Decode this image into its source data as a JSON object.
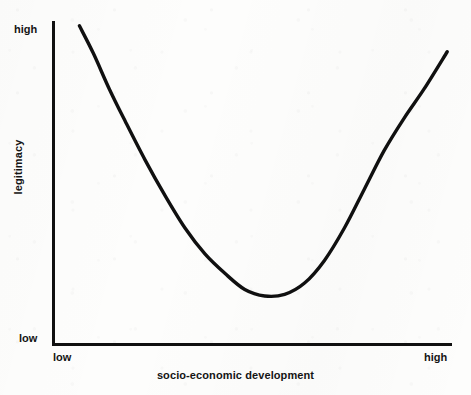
{
  "figure": {
    "background_color": "#fdfdfc",
    "ink_color": "#101010",
    "width": 471,
    "height": 395
  },
  "chart_data": {
    "type": "line",
    "title": "",
    "subtitle": "",
    "xlabel": "socio-economic development",
    "ylabel": "legitimacy",
    "grid": false,
    "legend": null,
    "legend_position": "none",
    "xlim": [
      0,
      100
    ],
    "ylim": [
      0,
      100
    ],
    "x_tick_labels": [
      "low",
      "high"
    ],
    "y_tick_labels": [
      "low",
      "high"
    ],
    "x_tick_positions": [
      0,
      100
    ],
    "y_tick_positions": [
      0,
      100
    ],
    "annotations": [],
    "series": [
      {
        "name": "legitimacy",
        "color": "#101010",
        "line_width": 3,
        "x": [
          6.5,
          10,
          14,
          18,
          23,
          28,
          33,
          38,
          43,
          48,
          53,
          58,
          63,
          68,
          73,
          78,
          83,
          88,
          93,
          98.8
        ],
        "y": [
          98.5,
          90,
          79,
          69,
          57,
          46,
          36,
          28,
          22,
          17,
          15,
          15.5,
          19,
          26,
          36,
          48,
          60,
          70,
          79,
          90.5
        ]
      }
    ]
  },
  "labels": {
    "y_axis_high": "high",
    "y_axis_low": "low",
    "x_axis_low": "low",
    "x_axis_high": "high",
    "x_axis_title": "socio-economic development",
    "y_axis_title": "legitimacy"
  }
}
